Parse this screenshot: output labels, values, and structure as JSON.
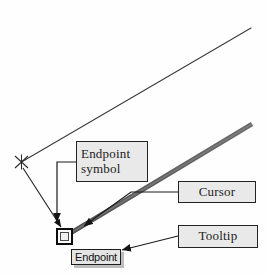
{
  "figure": {
    "background_color": "#fefefe",
    "width": 266,
    "height": 275
  },
  "callouts": [
    {
      "id": "endpoint-symbol",
      "label": "Endpoint\nsymbol",
      "fill_color": "#e9e9e9",
      "border_color": "#232323"
    },
    {
      "id": "cursor",
      "label": "Cursor",
      "fill_color": "#e9e9e9",
      "border_color": "#232323"
    },
    {
      "id": "tooltip",
      "label": "Tooltip",
      "fill_color": "#e9e9e9",
      "border_color": "#232323"
    }
  ],
  "tooltip": {
    "label": "Endpoint",
    "fill_color": "#e4e4e4",
    "border_color": "#1d1d1d",
    "shadow_color": "#bdbdbd"
  },
  "graphics": {
    "thin_line_color": "#3a3a3a",
    "cursor_line_color": "#555555",
    "leader_color": "#1a1a1a",
    "marker_color": "#2b2b2b",
    "endpoint_square_color": "#0d0d0d",
    "endpoint_marker_name": "x-marker",
    "drawing_line_name": "thin-construction-line",
    "cursor_line_name": "thick-cursor-line"
  }
}
